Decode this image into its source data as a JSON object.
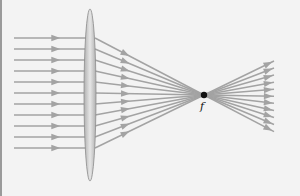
{
  "diagram": {
    "focal_label": "f",
    "colors": {
      "background": "#f3f3f3",
      "ray": "#a3a3a3",
      "lens_edge": "#8c8c8c",
      "lens_fill_center": "#e6e6e6",
      "lens_fill_edge": "#b0b0b0",
      "focal_point": "#111111",
      "border": "#9a9a9a"
    },
    "ray_count": 11,
    "incoming_ray_y": [
      38,
      49,
      60,
      71,
      82,
      93,
      104,
      115,
      126,
      137,
      148
    ],
    "lens": {
      "cx": 90,
      "cy": 95,
      "rx": 6,
      "ry": 86
    },
    "focal_point": {
      "x": 204,
      "y": 95
    }
  }
}
